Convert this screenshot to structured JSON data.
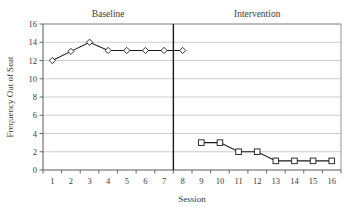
{
  "chart_data": {
    "type": "line",
    "title": "",
    "xlabel": "Session",
    "ylabel": "Frequency Out of Seat",
    "xlim": [
      0,
      16
    ],
    "ylim": [
      0,
      16
    ],
    "ytick_step": 2,
    "yticks": [
      0,
      2,
      4,
      6,
      8,
      10,
      12,
      14,
      16
    ],
    "xticks": [
      1,
      2,
      3,
      4,
      5,
      6,
      7,
      8,
      9,
      10,
      11,
      12,
      13,
      14,
      15,
      16
    ],
    "grid": "horizontal",
    "legend": "none",
    "phase_divider_x": 8,
    "annotations": [
      {
        "text": "Baseline",
        "x": 4
      },
      {
        "text": "Intervention",
        "x": 12
      }
    ],
    "series": [
      {
        "name": "Baseline",
        "marker": "open-diamond",
        "x": [
          1,
          2,
          3,
          4,
          5,
          6,
          7,
          8
        ],
        "values": [
          12,
          13,
          14,
          13.1,
          13.1,
          13.1,
          13.1,
          13.1
        ]
      },
      {
        "name": "Intervention",
        "marker": "open-square",
        "x": [
          9,
          10,
          11,
          12,
          13,
          14,
          15,
          16
        ],
        "values": [
          3,
          3,
          2,
          2,
          1,
          1,
          1,
          1
        ]
      }
    ]
  },
  "colors": {
    "line": "#1a1a1a",
    "marker_fill": "#ffffff",
    "grid": "#b8b8b8",
    "frame": "#8a8a8a",
    "divider": "#1a1a1a",
    "background": "#ffffff"
  }
}
